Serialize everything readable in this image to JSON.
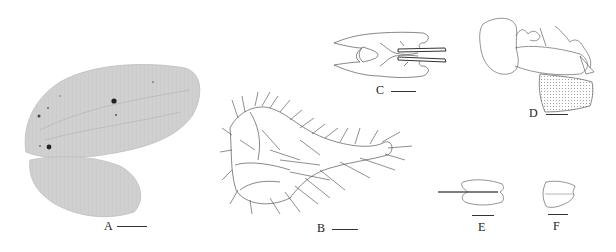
{
  "figure": {
    "panels": [
      {
        "id": "A",
        "label": "A",
        "subject": "forewing-and-hindwing-photo"
      },
      {
        "id": "B",
        "label": "B",
        "subject": "setose-appendage-drawing"
      },
      {
        "id": "C",
        "label": "C",
        "subject": "genital-structure-dorsal-drawing"
      },
      {
        "id": "D",
        "label": "D",
        "subject": "genital-structure-lateral-drawing"
      },
      {
        "id": "E",
        "label": "E",
        "subject": "bilobed-structure-with-rod-drawing"
      },
      {
        "id": "F",
        "label": "F",
        "subject": "bilobed-structure-drawing"
      }
    ],
    "colors": {
      "background": "#ffffff",
      "wing_fill": "#cfcfcf",
      "line_art": "#555555",
      "label_text": "#222222"
    }
  }
}
